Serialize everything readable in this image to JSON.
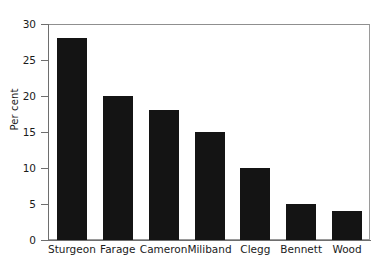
{
  "chart_data": {
    "type": "bar",
    "title": "",
    "xlabel": "",
    "ylabel": "Per cent",
    "categories": [
      "Sturgeon",
      "Farage",
      "Cameron",
      "Miliband",
      "Clegg",
      "Bennett",
      "Wood"
    ],
    "values": [
      28,
      20,
      18,
      15,
      10,
      5,
      4
    ],
    "ylim": [
      0,
      30
    ],
    "yticks": [
      0,
      5,
      10,
      15,
      20,
      25,
      30
    ],
    "ytick_labels": [
      "0",
      "5",
      "10",
      "15",
      "20",
      "25",
      "30"
    ],
    "grid": false,
    "legend": null,
    "bar_color": "#141414",
    "frame_color": "#9a9a9a",
    "axis_color": "#6e6e6e",
    "background": "#ffffff"
  }
}
